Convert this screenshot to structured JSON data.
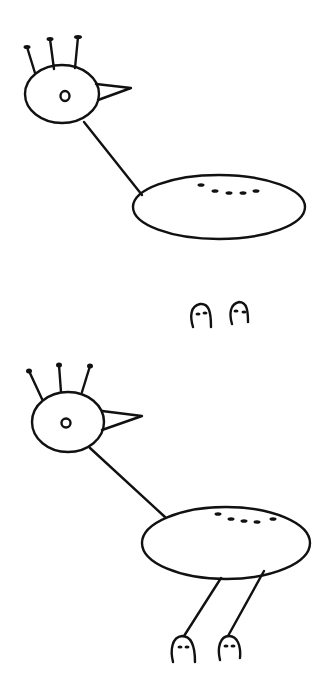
{
  "canvas": {
    "width": 330,
    "height": 689,
    "background": "#ffffff",
    "ink": "#111111"
  },
  "panels": [
    {
      "name": "bird-without-legs",
      "description": "Drawing of a bird: head with three crest feathers, eye, beak, neck line, oval body with dash markings; no legs"
    },
    {
      "name": "detached-feet",
      "description": "Two separate rounded feet with dash markings"
    },
    {
      "name": "bird-with-legs",
      "description": "Same bird with two legs attached to the body, ending in the feet"
    }
  ]
}
